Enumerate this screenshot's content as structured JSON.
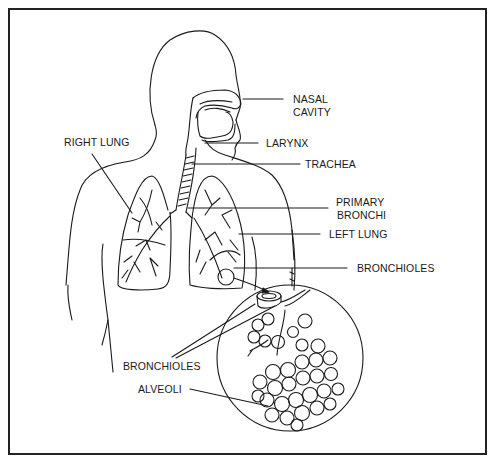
{
  "diagram": {
    "title": "",
    "labels": {
      "nasal_cavity_line1": "NASAL",
      "nasal_cavity_line2": "CAVITY",
      "larynx": "LARYNX",
      "right_lung": "RIGHT LUNG",
      "trachea": "TRACHEA",
      "primary_bronchi_line1": "PRIMARY",
      "primary_bronchi_line2": "BRONCHI",
      "left_lung": "LEFT LUNG",
      "bronchioles_right": "BRONCHIOLES",
      "bronchioles_left": "BRONCHIOLES",
      "alveoli": "ALVEOLI"
    },
    "colors": {
      "line": "#1a1a1a",
      "background": "#ffffff"
    }
  }
}
